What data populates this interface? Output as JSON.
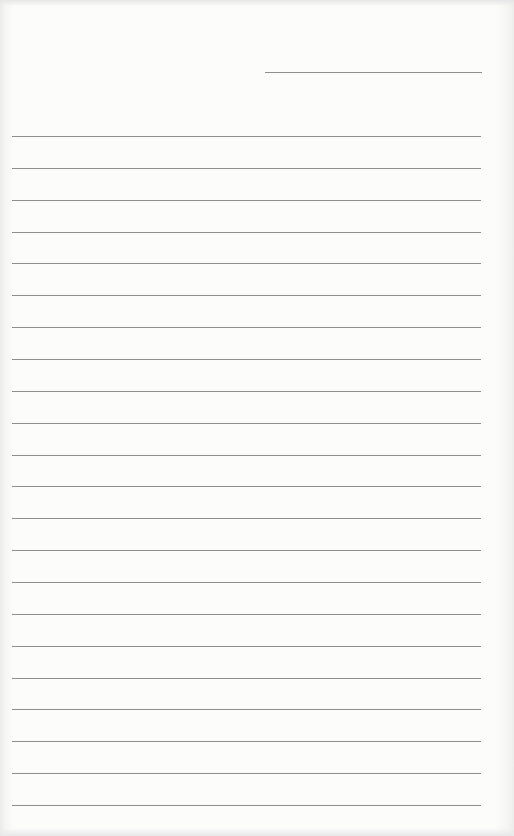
{
  "page": {
    "type": "lined-paper",
    "background_color": "#fcfcfb",
    "line_color": "#8f8f8f",
    "date_line": {
      "x1": 265,
      "x2": 482,
      "y": 72
    },
    "ruled_lines": {
      "count": 22,
      "x1": 12,
      "x2": 481,
      "first_y": 136,
      "last_y": 805,
      "spacing": 31.86
    }
  }
}
